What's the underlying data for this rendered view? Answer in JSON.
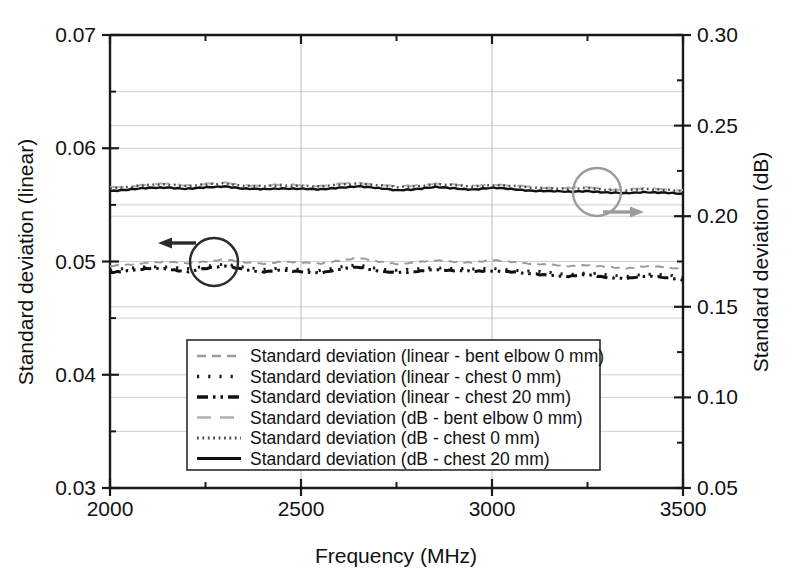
{
  "figure": {
    "width": 796,
    "height": 580,
    "background": "#ffffff"
  },
  "axes": {
    "x": {
      "title": "Frequency (MHz)",
      "ticklabels": [
        "2000",
        "2500",
        "3000",
        "3500"
      ],
      "min": 2000,
      "max": 3500,
      "major_step": 500,
      "minor_step": 250
    },
    "y_left": {
      "title": "Standard deviation (linear)",
      "ticklabels": [
        "0.07",
        "0.06",
        "0.05",
        "0.04",
        "0.03"
      ],
      "min": 0.03,
      "max": 0.07,
      "major_step": 0.01,
      "minor_step": 0.005
    },
    "y_right": {
      "title": "Standard deviation (dB)",
      "ticklabels": [
        "0.30",
        "0.25",
        "0.20",
        "0.15",
        "0.10",
        "0.05"
      ],
      "min": 0.05,
      "max": 0.3,
      "major_step": 0.05,
      "minor_step": 0.025
    }
  },
  "legend": {
    "items": [
      {
        "label": "Standard deviation (linear - bent elbow 0 mm)",
        "style": "dashed",
        "color": "#9a9a9a",
        "axis": "left"
      },
      {
        "label": "Standard deviation (linear - chest 0 mm)",
        "style": "dotted-sparse",
        "color": "#1a1a1a",
        "axis": "left"
      },
      {
        "label": "Standard deviation (linear - chest 20 mm)",
        "style": "dash-dot-dot",
        "color": "#101010",
        "axis": "left"
      },
      {
        "label": "Standard deviation (dB - bent elbow 0 mm)",
        "style": "dash-long-gray",
        "color": "#b0b0b0",
        "axis": "right"
      },
      {
        "label": "Standard deviation (dB - chest 0 mm)",
        "style": "dotted-fine",
        "color": "#4a4a4a",
        "axis": "right"
      },
      {
        "label": "Standard deviation (dB - chest 20 mm)",
        "style": "solid",
        "color": "#111111",
        "axis": "right"
      }
    ]
  },
  "annotations": [
    {
      "name": "left-axis-pointer",
      "shape": "circle-with-left-arrow",
      "color": "#2b2b2b",
      "points_to": "left axis"
    },
    {
      "name": "right-axis-pointer",
      "shape": "circle-with-right-arrow",
      "color": "#9b9b9b",
      "points_to": "right axis"
    }
  ],
  "chart_data": {
    "type": "line",
    "title": "",
    "xlabel": "Frequency (MHz)",
    "ylabel": "Standard deviation (linear)",
    "ylabel_right": "Standard deviation (dB)",
    "xlim": [
      2000,
      3500
    ],
    "ylim": [
      0.03,
      0.07
    ],
    "ylim_right": [
      0.05,
      0.3
    ],
    "grid": true,
    "legend_position": "lower-center-inside",
    "x": [
      2000,
      2050,
      2100,
      2150,
      2200,
      2250,
      2300,
      2350,
      2400,
      2450,
      2500,
      2550,
      2600,
      2650,
      2700,
      2750,
      2800,
      2850,
      2900,
      2950,
      3000,
      3050,
      3100,
      3150,
      3200,
      3250,
      3300,
      3350,
      3400,
      3450,
      3500
    ],
    "series": [
      {
        "name": "Standard deviation (linear - bent elbow 0 mm)",
        "axis": "left",
        "units": "linear",
        "values": [
          0.0496,
          0.0497,
          0.0499,
          0.05,
          0.0498,
          0.05,
          0.0502,
          0.0499,
          0.0498,
          0.05,
          0.0499,
          0.0498,
          0.0501,
          0.0503,
          0.05,
          0.0498,
          0.0499,
          0.0501,
          0.05,
          0.0499,
          0.0501,
          0.05,
          0.0498,
          0.0497,
          0.0496,
          0.0497,
          0.0495,
          0.0494,
          0.0496,
          0.0495,
          0.0493
        ]
      },
      {
        "name": "Standard deviation (linear - chest 0 mm)",
        "axis": "left",
        "units": "linear",
        "values": [
          0.0492,
          0.0494,
          0.0496,
          0.0495,
          0.0493,
          0.0496,
          0.0498,
          0.0495,
          0.0493,
          0.0494,
          0.0493,
          0.0492,
          0.0495,
          0.0497,
          0.0494,
          0.0492,
          0.0493,
          0.0495,
          0.0494,
          0.0493,
          0.0494,
          0.0493,
          0.0491,
          0.049,
          0.0489,
          0.049,
          0.0488,
          0.0487,
          0.0489,
          0.0488,
          0.0486
        ]
      },
      {
        "name": "Standard deviation (linear - chest 20 mm)",
        "axis": "left",
        "units": "linear",
        "values": [
          0.049,
          0.0492,
          0.0494,
          0.0493,
          0.0491,
          0.0494,
          0.0496,
          0.0493,
          0.0491,
          0.0492,
          0.0491,
          0.049,
          0.0493,
          0.0495,
          0.0492,
          0.049,
          0.0491,
          0.0493,
          0.0492,
          0.0491,
          0.0492,
          0.0491,
          0.0489,
          0.0488,
          0.0487,
          0.0488,
          0.0486,
          0.0485,
          0.0487,
          0.0486,
          0.0484
        ]
      },
      {
        "name": "Standard deviation (dB - bent elbow 0 mm)",
        "axis": "right",
        "units": "dB",
        "values": [
          0.216,
          0.2165,
          0.2175,
          0.218,
          0.217,
          0.2178,
          0.2185,
          0.2172,
          0.2168,
          0.2175,
          0.2172,
          0.2166,
          0.2178,
          0.2186,
          0.2174,
          0.2165,
          0.217,
          0.218,
          0.2174,
          0.2168,
          0.2176,
          0.217,
          0.2162,
          0.2158,
          0.2155,
          0.216,
          0.215,
          0.2146,
          0.2154,
          0.215,
          0.2142
        ]
      },
      {
        "name": "Standard deviation (dB - chest 0 mm)",
        "axis": "right",
        "units": "dB",
        "values": [
          0.2155,
          0.2162,
          0.2172,
          0.2176,
          0.2166,
          0.2174,
          0.2182,
          0.2168,
          0.2164,
          0.217,
          0.2168,
          0.2162,
          0.2174,
          0.2182,
          0.217,
          0.216,
          0.2166,
          0.2176,
          0.217,
          0.2164,
          0.2172,
          0.2166,
          0.2158,
          0.2154,
          0.215,
          0.2156,
          0.2146,
          0.2142,
          0.215,
          0.2146,
          0.2138
        ]
      },
      {
        "name": "Standard deviation (dB - chest 20 mm)",
        "axis": "right",
        "units": "dB",
        "values": [
          0.214,
          0.2146,
          0.2156,
          0.216,
          0.215,
          0.2158,
          0.2166,
          0.2152,
          0.2148,
          0.2154,
          0.2152,
          0.2146,
          0.2158,
          0.2166,
          0.2154,
          0.2144,
          0.215,
          0.216,
          0.2154,
          0.2148,
          0.2156,
          0.215,
          0.2142,
          0.2138,
          0.2134,
          0.214,
          0.213,
          0.2126,
          0.2134,
          0.213,
          0.2122
        ]
      }
    ]
  }
}
